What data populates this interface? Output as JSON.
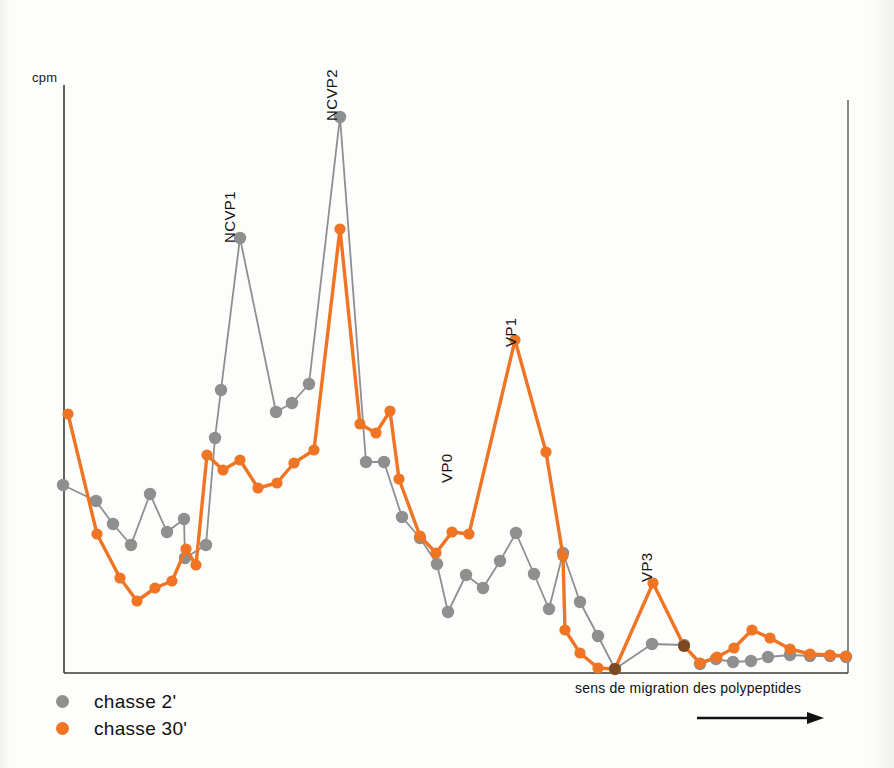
{
  "figure": {
    "y_axis_label": "cpm",
    "migration_caption": "sens de migration des polypeptides",
    "migration_arrow_glyph": "arrow-right"
  },
  "legend": {
    "position": "bottom-left",
    "items": [
      {
        "label": "chasse 2'",
        "color": "#8f8f8f",
        "marker": "circle"
      },
      {
        "label": "chasse 30'",
        "color": "#ef7423",
        "marker": "circle"
      }
    ]
  },
  "colors": {
    "series_gray": "#8f8f8f",
    "series_orange": "#ef7423",
    "overlap_brown": "#7b4a22",
    "axis": "#3a3a3a",
    "text": "#111111",
    "background": "#fdfdfb"
  },
  "annotations": [
    {
      "text": "NCVP1",
      "x": 238,
      "y": 226,
      "rotation": -90
    },
    {
      "text": "NCVP2",
      "x": 340,
      "y": 104,
      "rotation": -90
    },
    {
      "text": "VP0",
      "x": 455,
      "y": 466,
      "rotation": -90
    },
    {
      "text": "VP1",
      "x": 519,
      "y": 330,
      "rotation": -90
    },
    {
      "text": "VP3",
      "x": 655,
      "y": 565,
      "rotation": -90
    }
  ],
  "chart_data": {
    "type": "line",
    "title": "",
    "subtitle": "",
    "xlabel": "sens de migration des polypeptides",
    "ylabel": "cpm",
    "grid": false,
    "legend_position": "bottom-left",
    "axis_ranges": {
      "x_pixel": [
        64,
        848
      ],
      "y_pixel_top": 85,
      "y_pixel_baseline": 673,
      "x_ticks": [],
      "y_ticks": []
    },
    "note": "Electrophoresis profile: radioactivity (cpm) per gel fraction. Values are given as pixel coordinates of the plotted markers (origin top-left of the 894x768 image); the y axis is unlabelled on the figure itself.",
    "series": [
      {
        "name": "chasse 2'",
        "color": "#8f8f8f",
        "marker": "circle",
        "points": [
          [
            63,
            485
          ],
          [
            96,
            501
          ],
          [
            113,
            524
          ],
          [
            131,
            545
          ],
          [
            150,
            494
          ],
          [
            167,
            532
          ],
          [
            184,
            519
          ],
          [
            185,
            558
          ],
          [
            206,
            545
          ],
          [
            215,
            438
          ],
          [
            221,
            390
          ],
          [
            240,
            238
          ],
          [
            276,
            412
          ],
          [
            292,
            403
          ],
          [
            309,
            384
          ],
          [
            340,
            117
          ],
          [
            366,
            462
          ],
          [
            384,
            462
          ],
          [
            402,
            517
          ],
          [
            420,
            538
          ],
          [
            437,
            564
          ],
          [
            448,
            612
          ],
          [
            466,
            575
          ],
          [
            483,
            588
          ],
          [
            500,
            561
          ],
          [
            516,
            533
          ],
          [
            534,
            574
          ],
          [
            549,
            609
          ],
          [
            563,
            553
          ],
          [
            580,
            602
          ],
          [
            598,
            636
          ],
          [
            615,
            669
          ],
          [
            652,
            644
          ],
          [
            684,
            645
          ],
          [
            700,
            664
          ],
          [
            716,
            659
          ],
          [
            733,
            662
          ],
          [
            751,
            661
          ],
          [
            768,
            657
          ],
          [
            790,
            655
          ],
          [
            810,
            656
          ],
          [
            830,
            656
          ],
          [
            846,
            657
          ]
        ]
      },
      {
        "name": "chasse 30'",
        "color": "#ef7423",
        "marker": "circle",
        "points": [
          [
            68,
            414
          ],
          [
            97,
            534
          ],
          [
            120,
            578
          ],
          [
            137,
            601
          ],
          [
            155,
            588
          ],
          [
            172,
            581
          ],
          [
            186,
            549
          ],
          [
            196,
            565
          ],
          [
            207,
            455
          ],
          [
            223,
            470
          ],
          [
            240,
            460
          ],
          [
            258,
            488
          ],
          [
            277,
            483
          ],
          [
            294,
            463
          ],
          [
            314,
            450
          ],
          [
            340,
            229
          ],
          [
            360,
            424
          ],
          [
            376,
            433
          ],
          [
            390,
            411
          ],
          [
            399,
            479
          ],
          [
            420,
            536
          ],
          [
            436,
            553
          ],
          [
            452,
            532
          ],
          [
            469,
            534
          ],
          [
            515,
            340
          ],
          [
            546,
            452
          ],
          [
            563,
            556
          ],
          [
            565,
            630
          ],
          [
            580,
            653
          ],
          [
            598,
            668
          ],
          [
            615,
            669
          ],
          [
            653,
            583
          ],
          [
            684,
            646
          ],
          [
            700,
            663
          ],
          [
            717,
            657
          ],
          [
            734,
            648
          ],
          [
            752,
            630
          ],
          [
            770,
            638
          ],
          [
            790,
            649
          ],
          [
            810,
            654
          ],
          [
            830,
            655
          ],
          [
            846,
            656
          ]
        ]
      }
    ]
  }
}
